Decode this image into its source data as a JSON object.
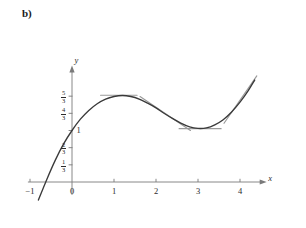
{
  "figure": {
    "panel_label": "b)",
    "background": "#ffffff",
    "curve_color": "#3a3a3a",
    "tangent_color": "#9a9a9a",
    "axis_color": "#7a7a7a"
  },
  "axes": {
    "x_axis_name": "x",
    "y_axis_name": "y",
    "x_ticks": [
      {
        "value": -1,
        "label": "−1"
      },
      {
        "value": 0,
        "label": "0"
      },
      {
        "value": 1,
        "label": "1"
      },
      {
        "value": 2,
        "label": "2"
      },
      {
        "value": 3,
        "label": "3"
      },
      {
        "value": 4,
        "label": "4"
      }
    ],
    "y_ticks": [
      {
        "value": 1.6667,
        "num": "5",
        "den": "3",
        "label": "5/3"
      },
      {
        "value": 1.3333,
        "num": "4",
        "den": "3",
        "label": "4/3"
      },
      {
        "value": 1.0,
        "num": "",
        "den": "",
        "label": "1"
      },
      {
        "value": 0.6667,
        "num": "2",
        "den": "3",
        "label": "2/3"
      },
      {
        "value": 0.3333,
        "num": "1",
        "den": "3",
        "label": "1/3"
      }
    ],
    "xlim": [
      -1.05,
      4.6
    ],
    "ylim": [
      -0.35,
      2.35
    ],
    "grid": false
  },
  "chart_data": {
    "type": "line",
    "title": "",
    "subtitle": "",
    "xlabel": "x",
    "ylabel": "y",
    "xlim": [
      -1.05,
      4.6
    ],
    "ylim": [
      -0.35,
      2.35
    ],
    "grid": false,
    "legend": "none",
    "series": [
      {
        "name": "cubic-curve",
        "kind": "line",
        "color": "#3a3a3a",
        "x": [
          -0.8,
          -0.6,
          -0.4,
          -0.2,
          0.0,
          0.2,
          0.4,
          0.6,
          0.8,
          1.0,
          1.2,
          1.4,
          1.6,
          1.8,
          2.0,
          2.2,
          2.4,
          2.6,
          2.8,
          3.0,
          3.2,
          3.4,
          3.6,
          3.8,
          4.0,
          4.2,
          4.35
        ],
        "y": [
          -0.35,
          0.05,
          0.42,
          0.74,
          1.0,
          1.22,
          1.39,
          1.52,
          1.61,
          1.66,
          1.68,
          1.66,
          1.61,
          1.53,
          1.44,
          1.33,
          1.23,
          1.14,
          1.07,
          1.04,
          1.05,
          1.11,
          1.21,
          1.36,
          1.55,
          1.78,
          1.98
        ]
      },
      {
        "name": "tangent-at-local-max",
        "kind": "segment",
        "color": "#9a9a9a",
        "x": [
          0.68,
          1.55
        ],
        "y": [
          1.685,
          1.685
        ]
      },
      {
        "name": "tangent-at-inflection",
        "kind": "segment",
        "color": "#9a9a9a",
        "x": [
          1.62,
          2.82
        ],
        "y": [
          1.66,
          1.0
        ]
      },
      {
        "name": "tangent-at-local-min",
        "kind": "segment",
        "color": "#9a9a9a",
        "x": [
          2.55,
          3.55
        ],
        "y": [
          1.035,
          1.035
        ]
      },
      {
        "name": "tangent-on-rising-branch",
        "kind": "segment",
        "color": "#9a9a9a",
        "x": [
          3.62,
          4.4
        ],
        "y": [
          1.14,
          2.06
        ]
      }
    ],
    "annotations": [
      {
        "name": "panel-label",
        "text": "b)",
        "x": -1.0,
        "y": 2.3
      }
    ]
  }
}
